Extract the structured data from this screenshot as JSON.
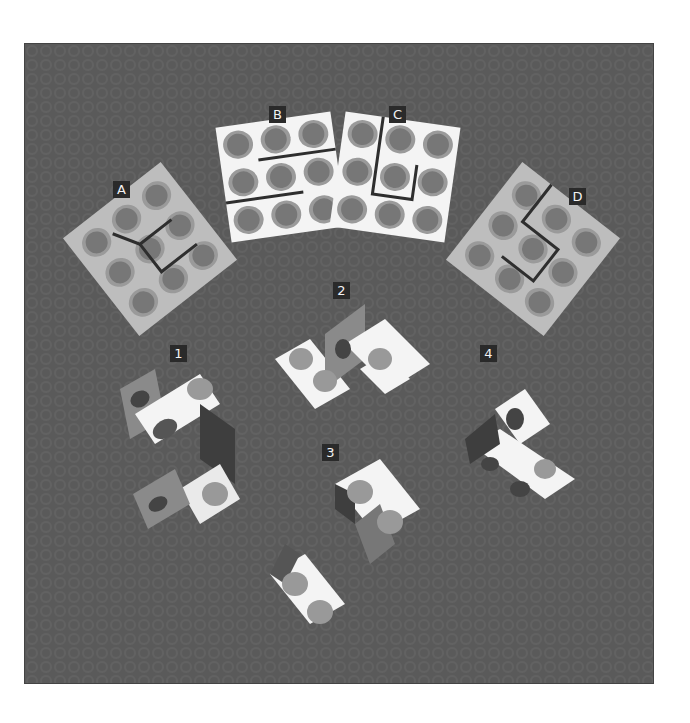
{
  "figure": {
    "type": "mental-rotation-puzzle",
    "colors": {
      "background": "#5a5a5a",
      "sheet_light": "#f4f4f4",
      "sheet_grey": "#bdbdbd",
      "circle_outer": "#9a9a9a",
      "circle_inner": "#777777",
      "fold_line": "#2e2e2e",
      "label_box": "#2a2a2a",
      "label_text": "#f2f2f2"
    },
    "patterns": [
      {
        "label": "A",
        "description": "3x3 dotted sheet with fold lines forming an S-like cut"
      },
      {
        "label": "B",
        "description": "3x3 dotted sheet with two horizontal fold lines"
      },
      {
        "label": "C",
        "description": "3x3 dotted sheet with U-shaped fold line"
      },
      {
        "label": "D",
        "description": "3x3 dotted sheet with zig-zag fold line"
      }
    ],
    "shapes": [
      {
        "label": "1",
        "description": "folded shape variant 1"
      },
      {
        "label": "2",
        "description": "folded shape variant 2"
      },
      {
        "label": "3",
        "description": "folded shape variant 3"
      },
      {
        "label": "4",
        "description": "folded shape variant 4"
      }
    ]
  }
}
